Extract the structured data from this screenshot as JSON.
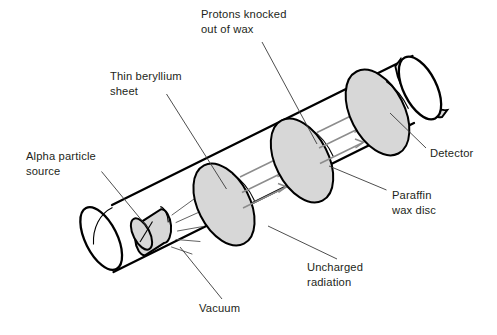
{
  "diagram": {
    "background_color": "#ffffff",
    "ink_color": "#231f20",
    "outline_color": "#000000",
    "disc_fill_color": "#d7d7d7",
    "arrow_color": "#8c8c8c",
    "leader_color": "#3a3a3a"
  },
  "labels": [
    {
      "id": "protons-knocked-out-of-wax",
      "line1": "Protons knocked",
      "line2": "out of wax",
      "x": 201,
      "y": 18,
      "anchor": "start"
    },
    {
      "id": "thin-beryllium-sheet",
      "line1": "Thin beryllium",
      "line2": "sheet",
      "x": 110,
      "y": 80,
      "anchor": "start"
    },
    {
      "id": "alpha-particle-source",
      "line1": "Alpha particle",
      "line2": "source",
      "x": 26,
      "y": 160,
      "anchor": "start"
    },
    {
      "id": "detector",
      "line1": "Detector",
      "line2": "",
      "x": 430,
      "y": 157,
      "anchor": "start"
    },
    {
      "id": "paraffin-wax-disc",
      "line1": "Paraffin",
      "line2": "wax disc",
      "x": 392,
      "y": 199,
      "anchor": "start"
    },
    {
      "id": "uncharged-radiation",
      "line1": "Uncharged",
      "line2": "radiation",
      "x": 307,
      "y": 271,
      "anchor": "start"
    },
    {
      "id": "vacuum",
      "line1": "Vacuum",
      "line2": "",
      "x": 199,
      "y": 312,
      "anchor": "start"
    }
  ],
  "components": [
    {
      "id": "vacuum-tube",
      "name": "Evacuated glass tube"
    },
    {
      "id": "alpha-source",
      "name": "Alpha particle source"
    },
    {
      "id": "beryllium-sheet",
      "name": "Thin beryllium sheet"
    },
    {
      "id": "paraffin-wax-disc",
      "name": "Paraffin wax disc"
    },
    {
      "id": "detector-disc",
      "name": "Detector"
    },
    {
      "id": "proton-arrows",
      "name": "Protons knocked out of wax"
    },
    {
      "id": "uncharged-radiation-arrows",
      "name": "Uncharged radiation"
    }
  ]
}
